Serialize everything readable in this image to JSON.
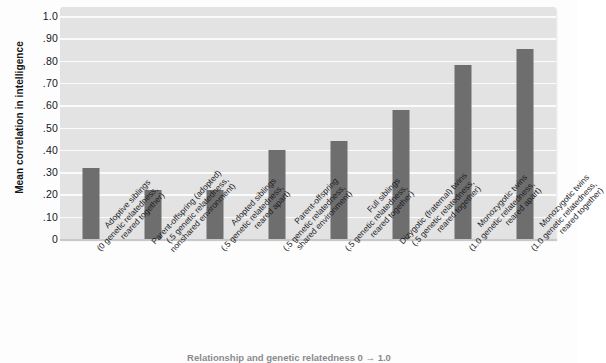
{
  "chart_data": {
    "type": "bar",
    "title": "",
    "ylabel": "Mean correlation in intelligence",
    "xlabel": "Relationship and genetic relatedness 0 → 1.0",
    "ylim": [
      0,
      1.0
    ],
    "grid": true,
    "legend": "none",
    "bar_color": "#6e6e6e",
    "plot_background": "#e3e3e3",
    "gridline_color": "#fbfbfb",
    "y_ticks": [
      "1.0",
      ".90",
      ".80",
      ".70",
      ".60",
      ".50",
      ".40",
      ".30",
      ".20",
      ".10",
      "0"
    ],
    "y_tick_values": [
      1.0,
      0.9,
      0.8,
      0.7,
      0.6,
      0.5,
      0.4,
      0.3,
      0.2,
      0.1,
      0.0
    ],
    "categories": [
      "Adoptive siblings (0 genetic relatedness, reared together)",
      "Parent-offspring (adopted) (.5 genetic relatedness, nonshared environment)",
      "Adopted siblings (.5 genetic relatedness, reared apart)",
      "Parent-offspring (.5 genetic relatedness, shared environment)",
      "Full siblings (.5 genetic relatedness, reared together)",
      "Dizygotic (fraternal) twins (.5 genetic relatedness, reared together)",
      "Monozygotic twins (1.0 genetic relatedness, reared apart)",
      "Monozygotic twins (1.0 genetic relatedness, reared together)"
    ],
    "category_lines": [
      [
        "Adoptive siblings",
        "(0 genetic relatedness,",
        "reared together)"
      ],
      [
        "Parent-offspring (adopted)",
        "(.5 genetic relatedness,",
        "nonshared environment)"
      ],
      [
        "Adopted siblings",
        "(.5 genetic relatedness,",
        "reared apart)"
      ],
      [
        "Parent-offspring",
        "(.5 genetic relatedness,",
        "shared environment)"
      ],
      [
        "Full siblings",
        "(.5 genetic relatedness,",
        "reared together)"
      ],
      [
        "Dizygotic (fraternal) twins",
        "(.5 genetic relatedness,",
        "reared together)"
      ],
      [
        "Monozygotic twins",
        "(1.0 genetic relatedness,",
        "reared apart)"
      ],
      [
        "Monozygotic twins",
        "(1.0 genetic relatedness,",
        "reared together)"
      ]
    ],
    "values": [
      0.32,
      0.22,
      0.22,
      0.4,
      0.44,
      0.58,
      0.78,
      0.85
    ]
  }
}
